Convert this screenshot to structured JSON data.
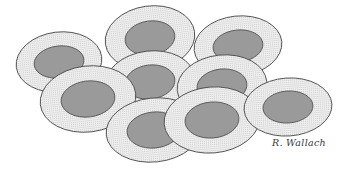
{
  "figure": {
    "background_color": "#ffffff",
    "cytoplasm_fill": "#eeeeee",
    "cytoplasm_stipple": "#c9c9c9",
    "cytoplasm_outline": "#4a4a4a",
    "nucleus_fill": "#9a9a9a",
    "nucleus_outline": "#565656",
    "cell_count": "9"
  },
  "signature": {
    "text": "R. Wallach",
    "position": "bottom-right",
    "color": "#3a3a3a"
  },
  "cells": [
    {
      "id": "cell-top-center",
      "label": "Cell 1",
      "cx": 150,
      "cy": 38,
      "rx": 45,
      "ry": 32,
      "rot": -8,
      "nucleus_cx": 150,
      "nucleus_cy": 38,
      "nucleus_rx": 25,
      "nucleus_ry": 17
    },
    {
      "id": "cell-top-right",
      "label": "Cell 2",
      "cx": 238,
      "cy": 46,
      "rx": 44,
      "ry": 30,
      "rot": -6,
      "nucleus_cx": 238,
      "nucleus_cy": 46,
      "nucleus_rx": 25,
      "nucleus_ry": 16
    },
    {
      "id": "cell-left-upper",
      "label": "Cell 3",
      "cx": 59,
      "cy": 62,
      "rx": 43,
      "ry": 30,
      "rot": -7,
      "nucleus_cx": 59,
      "nucleus_cy": 62,
      "nucleus_rx": 25,
      "nucleus_ry": 16
    },
    {
      "id": "cell-mid-center",
      "label": "Cell 4",
      "cx": 150,
      "cy": 82,
      "rx": 45,
      "ry": 31,
      "rot": -7,
      "nucleus_cx": 150,
      "nucleus_cy": 82,
      "nucleus_rx": 25,
      "nucleus_ry": 17
    },
    {
      "id": "cell-mid-right",
      "label": "Cell 5",
      "cx": 222,
      "cy": 86,
      "rx": 45,
      "ry": 31,
      "rot": -6,
      "nucleus_cx": 222,
      "nucleus_cy": 86,
      "nucleus_rx": 25,
      "nucleus_ry": 17
    },
    {
      "id": "cell-left-lower",
      "label": "Cell 6",
      "cx": 88,
      "cy": 99,
      "rx": 48,
      "ry": 33,
      "rot": -7,
      "nucleus_cx": 88,
      "nucleus_cy": 99,
      "nucleus_rx": 27,
      "nucleus_ry": 18
    },
    {
      "id": "cell-bottom-left",
      "label": "Cell 7",
      "cx": 154,
      "cy": 130,
      "rx": 48,
      "ry": 32,
      "rot": -6,
      "nucleus_cx": 154,
      "nucleus_cy": 130,
      "nucleus_rx": 27,
      "nucleus_ry": 18
    },
    {
      "id": "cell-bottom-center",
      "label": "Cell 8",
      "cx": 212,
      "cy": 120,
      "rx": 48,
      "ry": 33,
      "rot": -5,
      "nucleus_cx": 212,
      "nucleus_cy": 120,
      "nucleus_rx": 27,
      "nucleus_ry": 18
    },
    {
      "id": "cell-right-lower",
      "label": "Cell 9",
      "cx": 288,
      "cy": 107,
      "rx": 44,
      "ry": 29,
      "rot": -4,
      "nucleus_cx": 288,
      "nucleus_cy": 107,
      "nucleus_rx": 25,
      "nucleus_ry": 16
    }
  ]
}
